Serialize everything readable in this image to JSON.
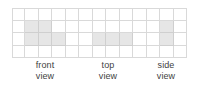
{
  "figure": {
    "background_color": "#ffffff"
  },
  "grid": {
    "columns": 13,
    "rows": 4,
    "line_color": "#d9d9d9",
    "cell_fill_color": "#ffffff",
    "shaded_fill_color": "#e6e6e6",
    "shaded_cells": [
      {
        "row": 2,
        "col": 2
      },
      {
        "row": 2,
        "col": 3
      },
      {
        "row": 3,
        "col": 2
      },
      {
        "row": 3,
        "col": 3
      },
      {
        "row": 3,
        "col": 4
      },
      {
        "row": 3,
        "col": 7
      },
      {
        "row": 3,
        "col": 8
      },
      {
        "row": 3,
        "col": 9
      },
      {
        "row": 2,
        "col": 12
      },
      {
        "row": 3,
        "col": 12
      }
    ]
  },
  "labels": [
    {
      "id": "front",
      "line1": "front",
      "line2": "view"
    },
    {
      "id": "top",
      "line1": "top",
      "line2": "view"
    },
    {
      "id": "side",
      "line1": "side",
      "line2": "view"
    }
  ]
}
